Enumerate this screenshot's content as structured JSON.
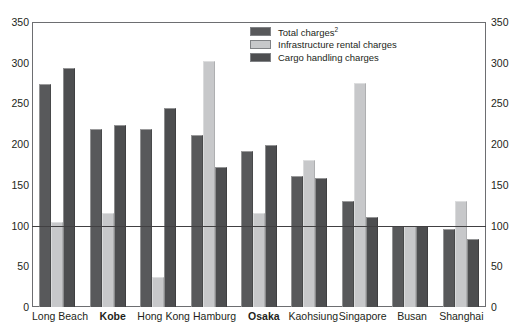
{
  "chart_data": {
    "type": "bar",
    "title": "",
    "subtitle": "",
    "xlabel": "",
    "ylabel": "",
    "ylim": [
      0,
      350
    ],
    "ytick_step": 50,
    "yticks": [
      0,
      50,
      100,
      150,
      200,
      250,
      300,
      350
    ],
    "ytick_labels": [
      "0",
      "50",
      "100",
      "150",
      "200",
      "250",
      "300",
      "350"
    ],
    "right_axis": true,
    "right_ytick_labels": [
      "0",
      "50",
      "100",
      "150",
      "200",
      "250",
      "300",
      "350"
    ],
    "grid": false,
    "reference_line": 100,
    "legend_position": "top-center-right",
    "categories": [
      "Long Beach",
      "Kobe",
      "Hong Kong",
      "Hamburg",
      "Osaka",
      "Kaohsiung",
      "Singapore",
      "Busan",
      "Shanghai"
    ],
    "bold_categories": [
      "Kobe",
      "Osaka"
    ],
    "series": [
      {
        "name": "Total charges",
        "name_superscript": "2",
        "color": "#58595b",
        "values": [
          274,
          219,
          219,
          211,
          191,
          161,
          130,
          100,
          96
        ]
      },
      {
        "name": "Infrastructure rental charges",
        "color": "#c7c8ca",
        "values": [
          105,
          115,
          37,
          302,
          116,
          181,
          275,
          100,
          130
        ]
      },
      {
        "name": "Cargo handling charges",
        "color": "#4d4e50",
        "values": [
          293,
          223,
          244,
          172,
          199,
          158,
          110,
          100,
          84
        ]
      }
    ]
  },
  "legend": {
    "entries": [
      {
        "label": "Total charges",
        "superscript": "2"
      },
      {
        "label": "Infrastructure rental charges",
        "superscript": ""
      },
      {
        "label": "Cargo handling charges",
        "superscript": ""
      }
    ]
  }
}
